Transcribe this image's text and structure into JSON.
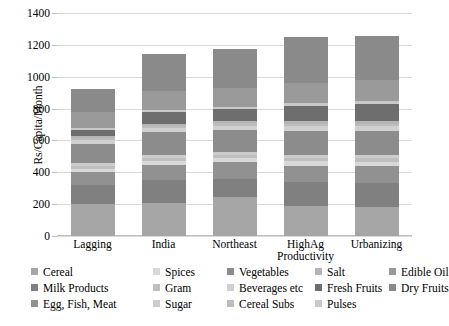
{
  "chart_data": {
    "type": "bar",
    "subtype": "stacked",
    "title": "",
    "xlabel": "",
    "ylabel": "Rs/Capita/Month",
    "ylim": [
      0,
      1400
    ],
    "ytick_step": 200,
    "yticks": [
      "0",
      "200",
      "400",
      "600",
      "800",
      "1000",
      "1200",
      "1400"
    ],
    "grid": true,
    "legend_position": "bottom",
    "categories": [
      "Lagging",
      "India",
      "Northeast",
      "HighAg Productivity",
      "Urbanizing"
    ],
    "category_labels": [
      {
        "line1": "Lagging",
        "line2": ""
      },
      {
        "line1": "India",
        "line2": ""
      },
      {
        "line1": "Northeast",
        "line2": ""
      },
      {
        "line1": "HighAg",
        "line2": "Productivity"
      },
      {
        "line1": "Urbanizing",
        "line2": ""
      }
    ],
    "series": [
      {
        "name": "Cereal",
        "color": "#a6a6a6",
        "values": [
          200,
          207,
          243,
          188,
          183
        ]
      },
      {
        "name": "Milk Products",
        "color": "#808080",
        "values": [
          118,
          145,
          112,
          150,
          150
        ]
      },
      {
        "name": "Egg, Fish, Meat",
        "color": "#919191",
        "values": [
          82,
          95,
          108,
          100,
          105
        ]
      },
      {
        "name": "Spices",
        "color": "#d9d9d9",
        "values": [
          22,
          25,
          28,
          30,
          28
        ]
      },
      {
        "name": "Gram",
        "color": "#bfbfbf",
        "values": [
          18,
          20,
          20,
          22,
          22
        ]
      },
      {
        "name": "Sugar",
        "color": "#cccccc",
        "values": [
          16,
          18,
          18,
          18,
          18
        ]
      },
      {
        "name": "Vegetables",
        "color": "#8c8c8c",
        "values": [
          120,
          140,
          135,
          150,
          152
        ]
      },
      {
        "name": "Beverages etc",
        "color": "#d0d0d0",
        "values": [
          24,
          26,
          28,
          30,
          30
        ]
      },
      {
        "name": "Cereal Subs",
        "color": "#bdbdbd",
        "values": [
          14,
          16,
          16,
          18,
          18
        ]
      },
      {
        "name": "Salt",
        "color": "#b5b5b5",
        "values": [
          12,
          14,
          14,
          14,
          14
        ]
      },
      {
        "name": "Fresh Fruits",
        "color": "#6e6e6e",
        "values": [
          40,
          70,
          75,
          95,
          110
        ]
      },
      {
        "name": "Pulses",
        "color": "#c9c9c9",
        "values": [
          14,
          16,
          16,
          18,
          18
        ]
      },
      {
        "name": "Edible Oil",
        "color": "#9a9a9a",
        "values": [
          100,
          120,
          118,
          130,
          130
        ]
      },
      {
        "name": "Dry Fruits",
        "color": "#8a8a8a",
        "values": [
          140,
          228,
          244,
          287,
          277
        ]
      }
    ],
    "totals": [
      920,
      1120,
      1175,
      1250,
      1255
    ]
  },
  "legend": {
    "columns": [
      {
        "items": [
          {
            "label": "Cereal",
            "color": "#a6a6a6"
          },
          {
            "label": "Milk Products",
            "color": "#808080"
          },
          {
            "label": "Egg, Fish, Meat",
            "color": "#919191"
          }
        ]
      },
      {
        "items": [
          {
            "label": "Spices",
            "color": "#d9d9d9"
          },
          {
            "label": "Gram",
            "color": "#bfbfbf"
          },
          {
            "label": "Sugar",
            "color": "#cccccc"
          }
        ]
      },
      {
        "items": [
          {
            "label": "Vegetables",
            "color": "#8c8c8c"
          },
          {
            "label": "Beverages etc",
            "color": "#d0d0d0"
          },
          {
            "label": "Cereal Subs",
            "color": "#bdbdbd"
          }
        ]
      },
      {
        "items": [
          {
            "label": "Salt",
            "color": "#b5b5b5"
          },
          {
            "label": "Fresh Fruits",
            "color": "#6e6e6e"
          },
          {
            "label": "Pulses",
            "color": "#c9c9c9"
          }
        ]
      },
      {
        "items": [
          {
            "label": "Edible Oil",
            "color": "#9a9a9a"
          },
          {
            "label": "Dry Fruits",
            "color": "#8a8a8a"
          }
        ]
      }
    ]
  },
  "colors": {
    "gridline": "#d9d9d9",
    "axis": "#bfbfbf",
    "text": "#000000",
    "background": "#ffffff"
  }
}
